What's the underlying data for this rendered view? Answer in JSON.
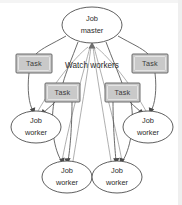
{
  "diagram": {
    "colors": {
      "background": "#ffffff",
      "box_fill": "#c9c9c9",
      "box_stroke": "#5c5c5c",
      "ellipse_fill": "#ffffff",
      "ellipse_stroke": "#4d4d4d",
      "edge_stroke": "#5a5a5a",
      "text": "#2b2b2b"
    },
    "annotations": [
      {
        "id": "watch-workers",
        "text": "Watch workers",
        "x": 92,
        "y": 66
      }
    ],
    "nodes": [
      {
        "id": "job-master",
        "kind": "ellipse",
        "line1": "Job",
        "line2": "master",
        "cx": 92,
        "cy": 25,
        "rx": 30,
        "ry": 18
      },
      {
        "id": "task-left-outer",
        "kind": "box",
        "label": "Task",
        "x": 16,
        "y": 54,
        "w": 36,
        "h": 19
      },
      {
        "id": "task-right-outer",
        "kind": "box",
        "label": "Task",
        "x": 132,
        "y": 54,
        "w": 36,
        "h": 19
      },
      {
        "id": "task-left-inner",
        "kind": "box",
        "label": "Task",
        "x": 45,
        "y": 83,
        "w": 35,
        "h": 19
      },
      {
        "id": "task-right-inner",
        "kind": "box",
        "label": "Task",
        "x": 105,
        "y": 83,
        "w": 35,
        "h": 19
      },
      {
        "id": "job-worker-left",
        "kind": "ellipse",
        "line1": "Job",
        "line2": "worker",
        "cx": 36,
        "cy": 127,
        "rx": 25,
        "ry": 16
      },
      {
        "id": "job-worker-right",
        "kind": "ellipse",
        "line1": "Job",
        "line2": "worker",
        "cx": 148,
        "cy": 127,
        "rx": 25,
        "ry": 16
      },
      {
        "id": "job-worker-bottom-left",
        "kind": "ellipse",
        "line1": "Job",
        "line2": "worker",
        "cx": 67,
        "cy": 177,
        "rx": 25,
        "ry": 16
      },
      {
        "id": "job-worker-bottom-right",
        "kind": "ellipse",
        "line1": "Job",
        "line2": "worker",
        "cx": 117,
        "cy": 177,
        "rx": 25,
        "ry": 16
      }
    ],
    "edges": [
      {
        "id": "master-to-task-left-outer",
        "from": "job-master",
        "to": "task-left-outer",
        "d": "M 66 36 C 52 44 42 48 36 54"
      },
      {
        "id": "master-to-task-right-outer",
        "from": "job-master",
        "to": "task-right-outer",
        "d": "M 118 36 C 132 44 142 48 148 54"
      },
      {
        "id": "master-to-task-left-inner",
        "from": "job-master",
        "to": "task-left-inner",
        "d": "M 78 42 C 72 58 66 72 63 83"
      },
      {
        "id": "master-to-task-right-inner",
        "from": "job-master",
        "to": "task-right-inner",
        "d": "M 106 42 C 112 58 118 72 122 83"
      },
      {
        "id": "task-left-outer-to-worker-left",
        "from": "task-left-outer",
        "to": "job-worker-left",
        "d": "M 29 73 C 27 90 29 104 33 111"
      },
      {
        "id": "task-right-outer-to-worker-right",
        "from": "task-right-outer",
        "to": "job-worker-right",
        "d": "M 155 73 C 157 90 155 104 151 111"
      },
      {
        "id": "task-left-inner-to-worker-left",
        "from": "task-left-inner",
        "to": "job-worker-left",
        "d": "M 55 102 C 50 107 46 110 43 113"
      },
      {
        "id": "task-right-inner-to-worker-right",
        "from": "task-right-inner",
        "to": "job-worker-right",
        "d": "M 130 102 C 135 107 139 110 142 113"
      },
      {
        "id": "task-left-inner-to-worker-bottom-left-a",
        "from": "task-left-inner",
        "to": "job-worker-bottom-left",
        "d": "M 54 102 C 50 125 54 150 62 162"
      },
      {
        "id": "task-left-inner-to-worker-bottom-left-b",
        "from": "task-left-inner",
        "to": "job-worker-bottom-left",
        "d": "M 72 102 C 72 126 70 150 68 161"
      },
      {
        "id": "task-right-inner-to-worker-bottom-right-a",
        "from": "task-right-inner",
        "to": "job-worker-bottom-right",
        "d": "M 113 102 C 113 126 115 150 116 161"
      },
      {
        "id": "task-right-inner-to-worker-bottom-right-b",
        "from": "task-right-inner",
        "to": "job-worker-bottom-right",
        "d": "M 131 102 C 135 125 130 150 122 162"
      },
      {
        "id": "worker-left-watch-master",
        "from": "job-worker-left",
        "to": "job-master",
        "d": "M 38 111 C 52 86 74 58 88 47"
      },
      {
        "id": "worker-bottom-left-watch-master",
        "from": "job-worker-bottom-left",
        "to": "job-master",
        "d": "M 62 161 C 70 118 84 70 90 47"
      },
      {
        "id": "worker-bottom-left2-watch-master",
        "from": "job-worker-bottom-left",
        "to": "job-master",
        "d": "M 73 161 C 80 118 88 70 91 47"
      },
      {
        "id": "worker-bottom-right-watch-master",
        "from": "job-worker-bottom-right",
        "to": "job-master",
        "d": "M 111 161 C 104 118 96 70 93 47"
      },
      {
        "id": "worker-bottom-right2-watch-master",
        "from": "job-worker-bottom-right",
        "to": "job-master",
        "d": "M 122 161 C 114 118 100 70 94 47"
      },
      {
        "id": "worker-right-watch-master",
        "from": "job-worker-right",
        "to": "job-master",
        "d": "M 146 111 C 132 86 110 58 96 47"
      }
    ]
  }
}
